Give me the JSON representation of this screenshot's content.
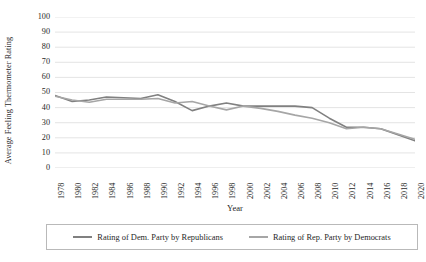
{
  "chart_data": {
    "type": "line",
    "title": "",
    "xlabel": "Year",
    "ylabel": "Average Feeling Thermometer Rating",
    "x": [
      1978,
      1980,
      1982,
      1984,
      1986,
      1988,
      1990,
      1992,
      1994,
      1996,
      1998,
      2000,
      2002,
      2004,
      2006,
      2008,
      2010,
      2012,
      2014,
      2016,
      2018,
      2020
    ],
    "xtick_labels": [
      "1978",
      "1980",
      "1982",
      "1984",
      "1986",
      "1988",
      "1990",
      "1992",
      "1994",
      "1996",
      "1998",
      "2000",
      "2002",
      "2004",
      "2006",
      "2008",
      "2010",
      "2012",
      "2014",
      "2016",
      "2018",
      "2020"
    ],
    "ytick_labels": [
      "100",
      "90",
      "80",
      "70",
      "60",
      "50",
      "40",
      "30",
      "20",
      "10",
      "0"
    ],
    "yticks": [
      100,
      90,
      80,
      70,
      60,
      50,
      40,
      30,
      20,
      10,
      0
    ],
    "ylim": [
      0,
      100
    ],
    "xlim": [
      1978,
      2020
    ],
    "grid": "horizontal",
    "legend_position": "bottom",
    "series": [
      {
        "name": "Rating of Dem. Party by Republicans",
        "color": "#808080",
        "values": [
          48,
          44,
          45,
          47,
          46.5,
          46,
          48.5,
          44,
          38,
          41,
          43,
          41,
          41,
          41,
          41,
          40,
          33,
          27,
          27,
          26,
          22,
          18
        ]
      },
      {
        "name": "Rating of Rep. Party by Democrats",
        "color": "#a6a6a6",
        "values": [
          47.5,
          45,
          43.5,
          45.5,
          45.5,
          45.5,
          46,
          43,
          44,
          41,
          38.5,
          41,
          39.5,
          37.5,
          35,
          33,
          30,
          26,
          27,
          26,
          22.5,
          19
        ]
      }
    ]
  },
  "legend": {
    "entries": [
      {
        "label": "Rating of Dem. Party by Republicans",
        "swatch": "legend-line-dem"
      },
      {
        "label": "Rating of Rep. Party by Democrats",
        "swatch": "legend-line-rep"
      }
    ]
  },
  "colors": {
    "series_dem": "#808080",
    "series_rep": "#a6a6a6",
    "gridline": "#d9d9d9",
    "text": "#1f1f1f",
    "legend_border": "#b9b9b9",
    "background": "#ffffff"
  }
}
